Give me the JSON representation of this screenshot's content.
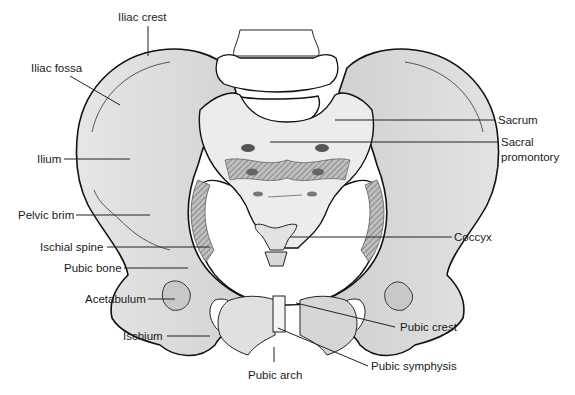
{
  "figure": {
    "labels": {
      "iliac_crest": "Iliac crest",
      "iliac_fossa": "Iliac fossa",
      "ilium": "Ilium",
      "pelvic_brim": "Pelvic brim",
      "ischial_spine": "Ischial spine",
      "pubic_bone": "Pubic bone",
      "acetabulum": "Acetabulum",
      "ischium": "Ischium",
      "sacrum": "Sacrum",
      "sacral_promontory_1": "Sacral",
      "sacral_promontory_2": "promontory",
      "coccyx": "Coccyx",
      "pubic_crest": "Pubic crest",
      "pubic_symphysis": "Pubic symphysis",
      "pubic_arch": "Pubic arch"
    },
    "colors": {
      "bone_fill": "#dcdcdc",
      "bone_light": "#ececec",
      "outline": "#111111",
      "leader": "#222222",
      "text": "#1a1a1a"
    }
  }
}
